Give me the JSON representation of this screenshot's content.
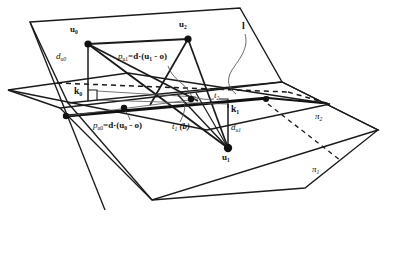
{
  "figure": {
    "type": "geometry-diagram",
    "background": "#ffffff",
    "stroke": "#1a1a1a",
    "width": 393,
    "height": 277
  },
  "labels": {
    "u0": {
      "text": "u",
      "sub": "0",
      "x": 72,
      "y": 30
    },
    "u2": {
      "text": "u",
      "sub": "2",
      "x": 180,
      "y": 25
    },
    "u1": {
      "text": "u",
      "sub": "1",
      "x": 224,
      "y": 158
    },
    "k0": {
      "text": "k",
      "sub": "0",
      "x": 77,
      "y": 93
    },
    "k1": {
      "text": "k",
      "sub": "1",
      "x": 232,
      "y": 111
    },
    "d_u0": {
      "text": "d",
      "sub": "u0",
      "x": 58,
      "y": 57
    },
    "d_u1": {
      "text": "d",
      "sub": "u1",
      "x": 232,
      "y": 128
    },
    "p_u1": {
      "prefix": "p",
      "sub": "u1",
      "body": "=d·(u",
      "bsub": "1",
      "tail": " - o)",
      "x": 121,
      "y": 57
    },
    "p_u0": {
      "prefix": "p",
      "sub": "u0",
      "body": "=d·(u",
      "bsub": "0",
      "tail": " - o)",
      "x": 96,
      "y": 126
    },
    "t1": {
      "text": "t",
      "sub": "1",
      "suffix": " (b)",
      "x": 175,
      "y": 128
    },
    "t2": {
      "text": "t",
      "sub": "2",
      "x": 216,
      "y": 96
    },
    "line_l": {
      "text": "l",
      "x": 243,
      "y": 26
    },
    "pi2": {
      "text": "π",
      "sub": "2",
      "x": 317,
      "y": 117
    },
    "pi1": {
      "text": "π",
      "sub": "1",
      "x": 314,
      "y": 170
    }
  },
  "points": [
    {
      "name": "u0",
      "x": 88,
      "y": 44,
      "r": 3.6
    },
    {
      "name": "u2",
      "x": 188,
      "y": 39,
      "r": 3.6
    },
    {
      "name": "u1",
      "x": 228,
      "y": 148,
      "r": 4.2
    },
    {
      "name": "p_u0_mark",
      "x": 124,
      "y": 108,
      "r": 3.2
    },
    {
      "name": "p_u1_mark",
      "x": 191,
      "y": 97,
      "r": 3.2
    },
    {
      "name": "o_origin",
      "x": 66,
      "y": 116,
      "r": 3.2
    }
  ],
  "legend": {
    "solid": "plane boundary / ray",
    "dashed": "hidden intersection line",
    "thick": "line l (plane intersection)"
  }
}
